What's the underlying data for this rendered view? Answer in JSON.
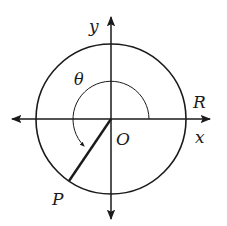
{
  "diagram": {
    "labels": {
      "y_axis": "y",
      "x_axis": "x",
      "origin": "O",
      "point_r": "R",
      "point_p": "P",
      "angle": "θ"
    },
    "colors": {
      "stroke": "#1a1a1a",
      "background": "#ffffff"
    }
  }
}
